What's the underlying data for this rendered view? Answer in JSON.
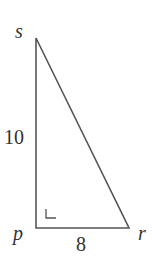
{
  "diagram": {
    "type": "right-triangle",
    "vertices": {
      "s": {
        "label": "s",
        "x": 36,
        "y": 38
      },
      "p": {
        "label": "p",
        "x": 36,
        "y": 228
      },
      "r": {
        "label": "r",
        "x": 129,
        "y": 228
      }
    },
    "sides": {
      "sp": {
        "label": "10"
      },
      "pr": {
        "label": "8"
      }
    },
    "right_angle_at": "p",
    "stroke_color": "#555555",
    "text_color": "#333333"
  }
}
